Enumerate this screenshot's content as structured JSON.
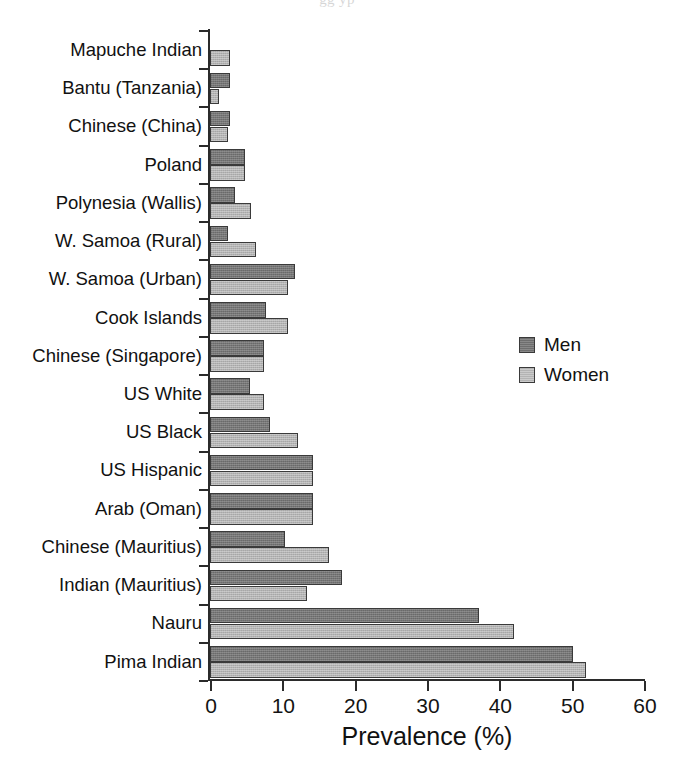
{
  "figure": {
    "bleed_text_above": "gg                                                                 yp",
    "legend_position": "right-middle"
  },
  "chart_data": {
    "type": "bar",
    "orientation": "horizontal",
    "title": "",
    "subtitle": "",
    "xlabel": "Prevalence (%)",
    "ylabel": "",
    "xlim": [
      0,
      60
    ],
    "xticks": [
      0,
      10,
      20,
      30,
      40,
      50,
      60
    ],
    "xtick_labels": [
      "0",
      "10",
      "20",
      "30",
      "40",
      "50",
      "60"
    ],
    "grid": false,
    "legend": [
      "Men",
      "Women"
    ],
    "colors": {
      "men": "#6e6e6e",
      "women": "#b3b3b3",
      "axis": "#2b2b2b",
      "text": "#111111",
      "background": "#ffffff"
    },
    "categories": [
      "Mapuche Indian",
      "Bantu (Tanzania)",
      "Chinese (China)",
      "Poland",
      "Polynesia (Wallis)",
      "W. Samoa (Rural)",
      "W. Samoa (Urban)",
      "Cook Islands",
      "Chinese (Singapore)",
      "US White",
      "US Black",
      "US Hispanic",
      "Arab (Oman)",
      "Chinese (Mauritius)",
      "Indian (Mauritius)",
      "Nauru",
      "Pima Indian"
    ],
    "series": [
      {
        "name": "Men",
        "values": [
          0.0,
          2.7,
          2.7,
          4.8,
          3.5,
          2.5,
          11.7,
          7.7,
          7.5,
          5.5,
          8.3,
          14.2,
          14.2,
          10.3,
          18.3,
          37.2,
          50.2
        ]
      },
      {
        "name": "Women",
        "values": [
          2.7,
          1.3,
          2.5,
          4.8,
          5.6,
          6.4,
          10.8,
          10.8,
          7.5,
          7.5,
          12.2,
          14.2,
          14.2,
          16.4,
          13.4,
          42.0,
          52.0
        ]
      }
    ]
  }
}
